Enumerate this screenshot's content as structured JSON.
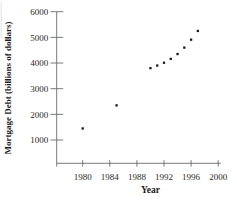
{
  "figure": {
    "background": "#ffffff",
    "axis_color": "#6b6b6b",
    "tick_text_color": "#2a2a2a",
    "label_text_color": "#1c1c1c",
    "point_color": "#1a1a1a"
  },
  "chart_data": {
    "type": "scatter",
    "title": "",
    "xlabel": "Year",
    "ylabel": "Mortgage Debt (billions of dollars)",
    "x_ticks": [
      1980,
      1984,
      1988,
      1992,
      1996,
      2000
    ],
    "y_ticks": [
      1000,
      2000,
      3000,
      4000,
      5000,
      6000
    ],
    "xlim": [
      1976,
      2000.6
    ],
    "ylim": [
      0,
      6000
    ],
    "grid": false,
    "legend": null,
    "points": [
      {
        "year": 1980,
        "value": 1450
      },
      {
        "year": 1985,
        "value": 2350
      },
      {
        "year": 1990,
        "value": 3800
      },
      {
        "year": 1991,
        "value": 3900
      },
      {
        "year": 1992,
        "value": 4010
      },
      {
        "year": 1993,
        "value": 4160
      },
      {
        "year": 1994,
        "value": 4350
      },
      {
        "year": 1995,
        "value": 4600
      },
      {
        "year": 1996,
        "value": 4910
      },
      {
        "year": 1997,
        "value": 5250
      }
    ]
  }
}
